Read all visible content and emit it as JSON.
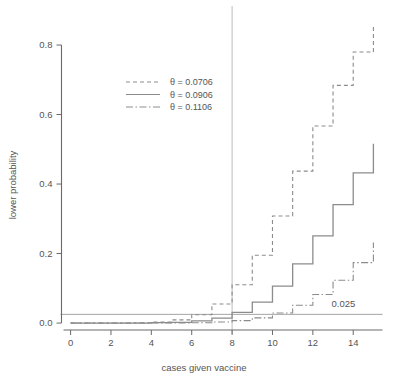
{
  "chart_data": {
    "type": "line",
    "subtype": "step",
    "title": "",
    "xlabel": "cases given vaccine",
    "ylabel": "lower probability",
    "xlim": [
      -0.45,
      15.45
    ],
    "ylim": [
      -0.02,
      0.895
    ],
    "xticks": [
      0,
      2,
      4,
      6,
      8,
      10,
      12,
      14
    ],
    "xtick_labels": [
      "0",
      "2",
      "4",
      "6",
      "8",
      "10",
      "12",
      "14"
    ],
    "yticks": [
      0.0,
      0.2,
      0.4,
      0.6,
      0.8
    ],
    "ytick_labels": [
      "0.0",
      "0.2",
      "0.4",
      "0.6",
      "0.8"
    ],
    "grid": false,
    "legend_position": "upper-left-inside",
    "x": [
      0,
      1,
      2,
      3,
      4,
      5,
      6,
      7,
      8,
      9,
      10,
      11,
      12,
      13,
      14,
      15
    ],
    "series": [
      {
        "name": "theta = 0.0706",
        "label": "θ = 0.0706",
        "linestyle": "dashed",
        "color": "#8c8c8c",
        "values": [
          0.0,
          0.0,
          0.0,
          0.001,
          0.003,
          0.009,
          0.024,
          0.055,
          0.11,
          0.195,
          0.308,
          0.437,
          0.567,
          0.684,
          0.78,
          0.855
        ]
      },
      {
        "name": "theta = 0.0906",
        "label": "θ = 0.0906",
        "linestyle": "solid",
        "color": "#8c8c8c",
        "values": [
          0.0,
          0.0,
          0.0,
          0.0,
          0.001,
          0.002,
          0.006,
          0.014,
          0.031,
          0.06,
          0.106,
          0.17,
          0.251,
          0.341,
          0.432,
          0.516
        ]
      },
      {
        "name": "theta = 0.1106",
        "label": "θ = 0.1106",
        "linestyle": "dashdot",
        "color": "#8c8c8c",
        "values": [
          0.0,
          0.0,
          0.0,
          0.0,
          0.0,
          0.0,
          0.001,
          0.003,
          0.007,
          0.015,
          0.029,
          0.051,
          0.082,
          0.123,
          0.174,
          0.232
        ]
      }
    ],
    "reference_lines": [
      {
        "name": "alpha-threshold",
        "orientation": "horizontal",
        "value": 0.025,
        "label": "0.025",
        "linestyle": "solid",
        "color": "#9a9a9a"
      },
      {
        "name": "observed-cases",
        "orientation": "vertical",
        "value": 8,
        "label": "",
        "linestyle": "solid",
        "color": "#bdbdbd"
      }
    ],
    "annotations": [
      {
        "name": "threshold-value",
        "text": "0.025",
        "x": 14.1,
        "y": 0.047
      }
    ]
  },
  "legend": {
    "entries": [
      {
        "label": "θ = 0.0706"
      },
      {
        "label": "θ = 0.0906"
      },
      {
        "label": "θ = 0.1106"
      }
    ]
  }
}
